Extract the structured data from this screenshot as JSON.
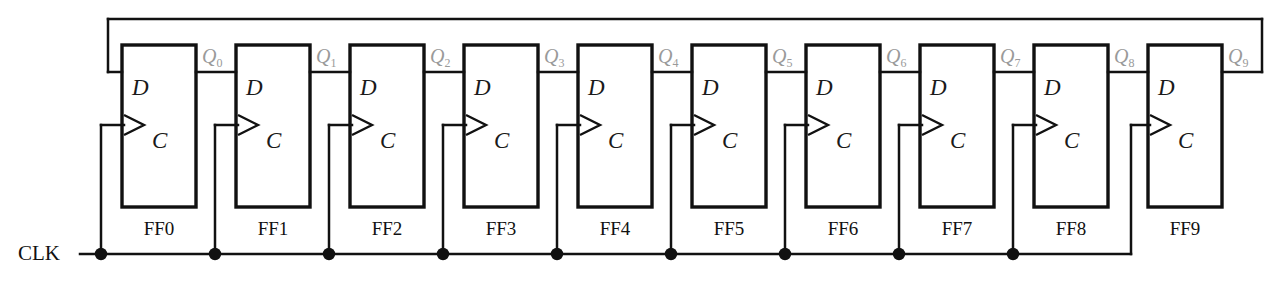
{
  "diagram": {
    "clock": {
      "label": "CLK",
      "line_y": 254,
      "line_x_start": 80,
      "line_x_end": 1131,
      "junction_count": 9
    },
    "feedback": {
      "description": "Q9 output routed back to FF0 D input along top rail",
      "from": "Q9",
      "to": "FF0.D",
      "rail_y": 19
    },
    "geometry": {
      "box_x0": 122,
      "box_y0": 45,
      "box_w": 74,
      "box_h": 162,
      "pitch": 114,
      "d_input_y": 72,
      "c_input_y": 125
    },
    "colors": {
      "wire": "#111111",
      "box_stroke": "#111111",
      "q_label": "#9a9a9a",
      "text": "#111111",
      "background": "#ffffff"
    },
    "pin_labels": {
      "d": "D",
      "c": "C"
    },
    "flipflops": [
      {
        "name": "FF0",
        "d": "D",
        "c": "C",
        "q": "Q",
        "q_sub": "0"
      },
      {
        "name": "FF1",
        "d": "D",
        "c": "C",
        "q": "Q",
        "q_sub": "1"
      },
      {
        "name": "FF2",
        "d": "D",
        "c": "C",
        "q": "Q",
        "q_sub": "2"
      },
      {
        "name": "FF3",
        "d": "D",
        "c": "C",
        "q": "Q",
        "q_sub": "3"
      },
      {
        "name": "FF4",
        "d": "D",
        "c": "C",
        "q": "Q",
        "q_sub": "4"
      },
      {
        "name": "FF5",
        "d": "D",
        "c": "C",
        "q": "Q",
        "q_sub": "5"
      },
      {
        "name": "FF6",
        "d": "D",
        "c": "C",
        "q": "Q",
        "q_sub": "6"
      },
      {
        "name": "FF7",
        "d": "D",
        "c": "C",
        "q": "Q",
        "q_sub": "7"
      },
      {
        "name": "FF8",
        "d": "D",
        "c": "C",
        "q": "Q",
        "q_sub": "8"
      },
      {
        "name": "FF9",
        "d": "D",
        "c": "C",
        "q": "Q",
        "q_sub": "9"
      }
    ]
  }
}
